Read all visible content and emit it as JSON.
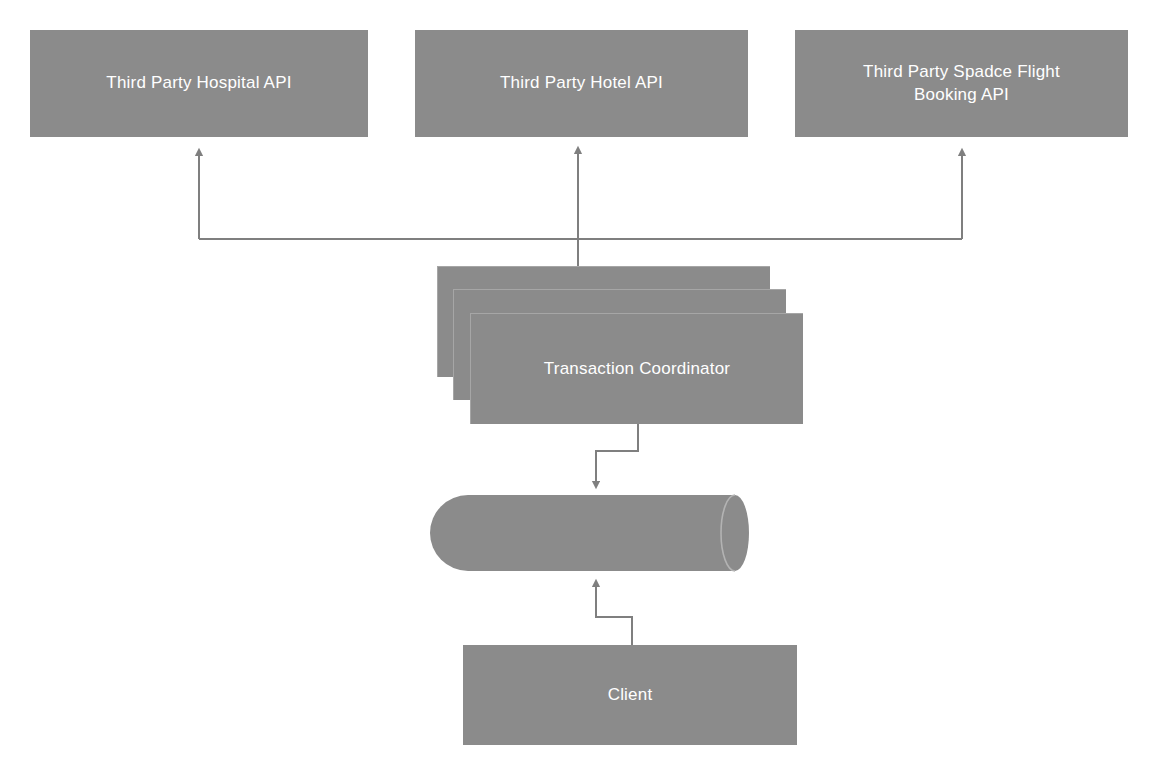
{
  "diagram": {
    "type": "flowchart",
    "background_color": "#ffffff",
    "node_fill_color": "#8b8b8b",
    "node_text_color": "#ffffff",
    "connector_color": "#7f7f7f",
    "nodes": [
      {
        "id": "hospital-api",
        "label": "Third Party Hospital API",
        "shape": "rectangle",
        "x": 30,
        "y": 30,
        "width": 338,
        "height": 107
      },
      {
        "id": "hotel-api",
        "label": "Third Party Hotel API",
        "shape": "rectangle",
        "x": 415,
        "y": 30,
        "width": 333,
        "height": 107
      },
      {
        "id": "flight-api",
        "label": "Third Party Spadce Flight Booking API",
        "shape": "rectangle",
        "x": 795,
        "y": 30,
        "width": 333,
        "height": 107
      },
      {
        "id": "transaction-coordinator",
        "label": "Transaction Coordinator",
        "shape": "stacked-rectangle",
        "x": 470,
        "y": 313,
        "width": 333,
        "height": 111,
        "stack_count": 3
      },
      {
        "id": "database",
        "label": "",
        "shape": "cylinder",
        "x": 430,
        "y": 495,
        "width": 333,
        "height": 76
      },
      {
        "id": "client",
        "label": "Client",
        "shape": "rectangle",
        "x": 463,
        "y": 645,
        "width": 334,
        "height": 100
      }
    ],
    "connectors": [
      {
        "id": "coordinator-to-hospital-api",
        "from": "transaction-coordinator",
        "to": "hospital-api",
        "arrow": "to"
      },
      {
        "id": "coordinator-to-hotel-api",
        "from": "transaction-coordinator",
        "to": "hotel-api",
        "arrow": "to"
      },
      {
        "id": "coordinator-to-flight-api",
        "from": "transaction-coordinator",
        "to": "flight-api",
        "arrow": "to"
      },
      {
        "id": "coordinator-to-database",
        "from": "transaction-coordinator",
        "to": "database",
        "arrow": "to"
      },
      {
        "id": "client-to-database",
        "from": "client",
        "to": "database",
        "arrow": "to"
      }
    ]
  }
}
